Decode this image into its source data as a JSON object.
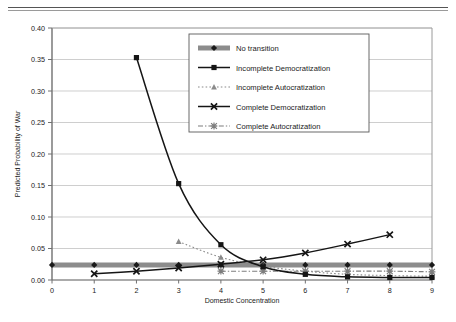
{
  "chart_data": {
    "type": "line",
    "title": "",
    "xlabel": "Domestic Concentration",
    "ylabel": "Predicted Probability of War",
    "xlim": [
      0,
      9
    ],
    "ylim": [
      0.0,
      0.4
    ],
    "xticks": [
      "0",
      "1",
      "2",
      "3",
      "4",
      "5",
      "6",
      "7",
      "8",
      "9"
    ],
    "yticks": [
      "0.00",
      "0.05",
      "0.10",
      "0.15",
      "0.20",
      "0.25",
      "0.30",
      "0.35",
      "0.40"
    ],
    "grid": "horizontal",
    "legend_position": "upper-center",
    "series": [
      {
        "name": "No transition",
        "marker": "diamond",
        "line": "thick-gray-band",
        "color": "#8c8c8c",
        "x": [
          0,
          1,
          2,
          3,
          4,
          5,
          6,
          7,
          8,
          9
        ],
        "values": [
          0.024,
          0.024,
          0.024,
          0.024,
          0.024,
          0.024,
          0.024,
          0.024,
          0.024,
          0.024
        ]
      },
      {
        "name": "Incomplete Democratization",
        "marker": "square",
        "line": "solid",
        "color": "#151515",
        "x": [
          2,
          3,
          4,
          5,
          6,
          7,
          8,
          9
        ],
        "values": [
          0.353,
          0.153,
          0.056,
          0.021,
          0.009,
          0.005,
          0.004,
          0.004
        ]
      },
      {
        "name": "Incomplete Autocratization",
        "marker": "triangle",
        "line": "dotted",
        "color": "#8a8a8a",
        "x": [
          3,
          4,
          5,
          6,
          7,
          8,
          9
        ],
        "values": [
          0.061,
          0.036,
          0.022,
          0.014,
          0.009,
          0.007,
          0.006
        ]
      },
      {
        "name": "Complete Democratization",
        "marker": "x",
        "line": "solid",
        "color": "#151515",
        "x": [
          1,
          2,
          3,
          4,
          5,
          6,
          7,
          8
        ],
        "values": [
          0.01,
          0.014,
          0.019,
          0.025,
          0.032,
          0.043,
          0.057,
          0.072
        ]
      },
      {
        "name": "Complete Autocratization",
        "marker": "asterisk",
        "line": "dash-dot",
        "color": "#7d7d7d",
        "x": [
          4,
          5,
          6,
          7,
          8,
          9
        ],
        "values": [
          0.014,
          0.014,
          0.014,
          0.014,
          0.014,
          0.013
        ]
      }
    ]
  },
  "legend": {
    "items": [
      {
        "label": "No transition"
      },
      {
        "label": "Incomplete Democratization"
      },
      {
        "label": "Incomplete Autocratization"
      },
      {
        "label": "Complete Democratization"
      },
      {
        "label": "Complete Autocratization"
      }
    ]
  }
}
